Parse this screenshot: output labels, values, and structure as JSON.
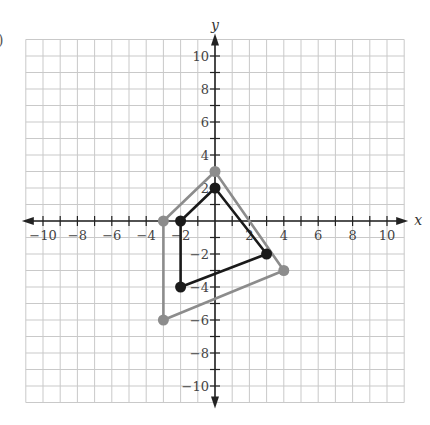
{
  "figure": {
    "partial_label": ")"
  },
  "chart_data": {
    "type": "scatter",
    "title": "",
    "xlabel": "x",
    "ylabel": "y",
    "xlim": [
      -11,
      11
    ],
    "ylim": [
      -11,
      11
    ],
    "grid": true,
    "x_ticks": [
      -10,
      -8,
      -6,
      -4,
      -2,
      2,
      4,
      6,
      8,
      10
    ],
    "y_ticks": [
      10,
      8,
      6,
      4,
      2,
      -2,
      -4,
      -6,
      -8,
      -10
    ],
    "series": [
      {
        "name": "gray-quadrilateral",
        "color": "#8c8c8c",
        "closed": true,
        "points": [
          [
            -3,
            0
          ],
          [
            0,
            3
          ],
          [
            4,
            -3
          ],
          [
            -3,
            -6
          ]
        ]
      },
      {
        "name": "black-quadrilateral",
        "color": "#1a1a1a",
        "closed": true,
        "points": [
          [
            -2,
            0
          ],
          [
            0,
            2
          ],
          [
            3,
            -2
          ],
          [
            -2,
            -4
          ]
        ]
      }
    ]
  }
}
